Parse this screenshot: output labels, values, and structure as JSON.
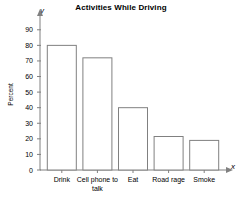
{
  "chart_data": {
    "type": "bar",
    "title": "Activities While Driving",
    "xlabel": "",
    "ylabel": "Percent",
    "categories": [
      "Drink",
      "Cell phone to talk",
      "Eat",
      "Road rage",
      "Smoke"
    ],
    "values": [
      80,
      72,
      40,
      21.5,
      19
    ],
    "ylim": [
      0,
      95
    ],
    "yticks": [
      0,
      10,
      20,
      30,
      40,
      50,
      60,
      70,
      80,
      90
    ],
    "grid": false,
    "legend": false,
    "axis_letters": {
      "x": "x",
      "y": "y"
    },
    "bar_style": {
      "fill": "#ffffff",
      "stroke": "#808080"
    },
    "axis_color": "#808080"
  }
}
